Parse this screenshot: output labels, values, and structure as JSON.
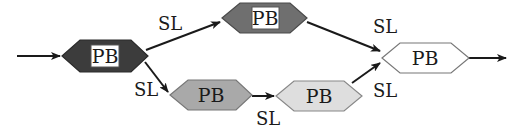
{
  "diagram": {
    "type": "flow",
    "width": 517,
    "height": 132,
    "nodes": [
      {
        "id": "n1",
        "label": "PB",
        "fill": "#3c3c3c",
        "stroke": "#2a2a2a",
        "boxed_label": true,
        "points": [
          [
            62,
            56
          ],
          [
            80,
            40
          ],
          [
            131,
            40
          ],
          [
            148,
            56
          ],
          [
            131,
            72
          ],
          [
            80,
            72
          ]
        ],
        "label_x": 105,
        "label_y": 63,
        "box": [
          91,
          45,
          28,
          22
        ]
      },
      {
        "id": "n2",
        "label": "PB",
        "fill": "#6f6f6f",
        "stroke": "#4a4a4a",
        "boxed_label": true,
        "points": [
          [
            222,
            18
          ],
          [
            240,
            3
          ],
          [
            290,
            3
          ],
          [
            307,
            18
          ],
          [
            290,
            33
          ],
          [
            240,
            33
          ]
        ],
        "label_x": 265,
        "label_y": 25,
        "box": [
          252,
          7,
          27,
          22
        ]
      },
      {
        "id": "n3",
        "label": "PB",
        "fill": "#a9a9a9",
        "stroke": "#777777",
        "boxed_label": false,
        "points": [
          [
            170,
            95
          ],
          [
            188,
            80
          ],
          [
            236,
            80
          ],
          [
            252,
            95
          ],
          [
            236,
            110
          ],
          [
            188,
            110
          ]
        ],
        "label_x": 211,
        "label_y": 102,
        "box": null
      },
      {
        "id": "n4",
        "label": "PB",
        "fill": "#dedede",
        "stroke": "#888888",
        "boxed_label": false,
        "points": [
          [
            276,
            96
          ],
          [
            294,
            81
          ],
          [
            344,
            81
          ],
          [
            362,
            96
          ],
          [
            344,
            111
          ],
          [
            294,
            111
          ]
        ],
        "label_x": 319,
        "label_y": 103,
        "box": null
      },
      {
        "id": "n5",
        "label": "PB",
        "fill": "#ffffff",
        "stroke": "#777777",
        "boxed_label": false,
        "points": [
          [
            382,
            58
          ],
          [
            400,
            43
          ],
          [
            451,
            43
          ],
          [
            469,
            58
          ],
          [
            451,
            73
          ],
          [
            400,
            73
          ]
        ],
        "label_x": 425,
        "label_y": 65,
        "box": null
      }
    ],
    "edges": [
      {
        "id": "e_in",
        "from": "input",
        "to": "n1",
        "label": "",
        "x1": 17,
        "y1": 56,
        "x2": 60,
        "y2": 56,
        "label_x": null,
        "label_y": null
      },
      {
        "id": "e1",
        "from": "n1",
        "to": "n2",
        "label": "SL",
        "x1": 146,
        "y1": 50,
        "x2": 220,
        "y2": 22,
        "label_x": 158,
        "label_y": 30
      },
      {
        "id": "e2",
        "from": "n1",
        "to": "n3",
        "label": "SL",
        "x1": 145,
        "y1": 62,
        "x2": 168,
        "y2": 92,
        "label_x": 134,
        "label_y": 96
      },
      {
        "id": "e3",
        "from": "n3",
        "to": "n4",
        "label": "SL",
        "x1": 252,
        "y1": 96,
        "x2": 274,
        "y2": 96,
        "label_x": 256,
        "label_y": 125
      },
      {
        "id": "e4",
        "from": "n2",
        "to": "n5",
        "label": "SL",
        "x1": 307,
        "y1": 22,
        "x2": 380,
        "y2": 51,
        "label_x": 373,
        "label_y": 33
      },
      {
        "id": "e5",
        "from": "n4",
        "to": "n5",
        "label": "SL",
        "x1": 352,
        "y1": 83,
        "x2": 380,
        "y2": 63,
        "label_x": 373,
        "label_y": 97
      },
      {
        "id": "e_out",
        "from": "n5",
        "to": "output",
        "label": "",
        "x1": 469,
        "y1": 58,
        "x2": 506,
        "y2": 58,
        "label_x": null,
        "label_y": null
      }
    ]
  }
}
